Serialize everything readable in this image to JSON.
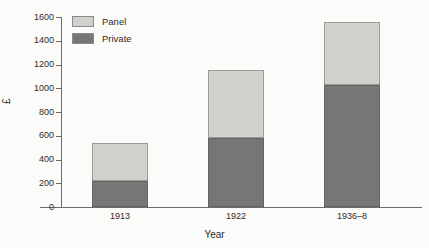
{
  "chart_data": {
    "type": "bar",
    "subtype": "stacked-bar",
    "title": "",
    "subtitle": "",
    "xlabel": "Year",
    "ylabel": "£",
    "categories": [
      "1913",
      "1922",
      "1936–8"
    ],
    "series": [
      {
        "name": "Private",
        "values": [
          220,
          580,
          1030
        ],
        "color": "#767676"
      },
      {
        "name": "Panel",
        "values": [
          315,
          570,
          530
        ],
        "color": "#d0d0cd"
      }
    ],
    "stack_order": [
      "Private",
      "Panel"
    ],
    "totals": [
      535,
      1150,
      1560
    ],
    "ylim": [
      0,
      1600
    ],
    "ytick_values": [
      0,
      200,
      400,
      600,
      800,
      1000,
      1200,
      1400,
      1600
    ],
    "ytick_labels": [
      "0",
      "200",
      "400",
      "600",
      "800",
      "1000",
      "1200",
      "1400",
      "1600"
    ],
    "grid": false,
    "legend_position": "top-left",
    "legend_entries": [
      "Panel",
      "Private"
    ]
  },
  "axes": {
    "y_title": "£",
    "x_title": "Year"
  },
  "legend": {
    "items": [
      {
        "label": "Panel",
        "color": "#d0d0cd"
      },
      {
        "label": "Private",
        "color": "#767676"
      }
    ]
  },
  "colors": {
    "panel": "#d0d0cd",
    "private": "#767676",
    "axis": "#6b6b6b",
    "background": "#fbfbfa",
    "text": "#2b2b2b"
  }
}
